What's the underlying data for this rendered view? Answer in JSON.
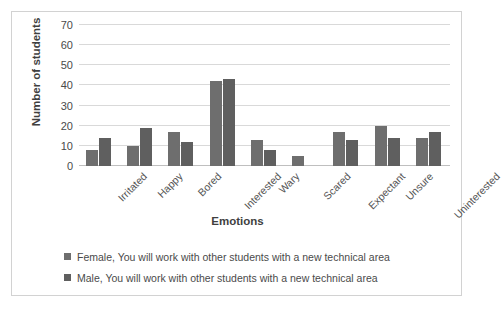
{
  "chart_data": {
    "type": "bar",
    "title": "",
    "xlabel": "Emotions",
    "ylabel": "Number of students",
    "ylim": [
      0,
      70
    ],
    "ytick_step": 10,
    "yticks": [
      70,
      60,
      50,
      40,
      30,
      20,
      10,
      0
    ],
    "grid": true,
    "legend_position": "bottom",
    "categories": [
      "Irritated",
      "Happy",
      "Bored",
      "Interested",
      "Wary",
      "Scared",
      "Expectant",
      "Unsure",
      "Uninterested"
    ],
    "series": [
      {
        "name": "Female, You will work with other students with a new technical area",
        "color": "#6e6e6e",
        "values": [
          8,
          10,
          17,
          42,
          13,
          5,
          17,
          20,
          14
        ]
      },
      {
        "name": "Male, You will work with other students with a new technical area",
        "color": "#5f5f5f",
        "values": [
          14,
          19,
          12,
          43,
          8,
          0,
          13,
          14,
          17
        ]
      }
    ]
  },
  "colors": {
    "border": "#d2d2d2",
    "gridline": "#d9d9d9",
    "axis": "#bfbfbf",
    "text": "#4a4a4a",
    "title_text": "#3f3f3f"
  }
}
